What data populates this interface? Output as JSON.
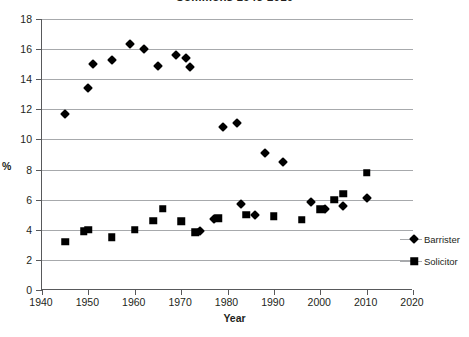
{
  "chart_data": {
    "type": "scatter",
    "title": "Commons 1945-2010",
    "xlabel": "Year",
    "ylabel": "%",
    "xlim": [
      1940,
      2020
    ],
    "ylim": [
      0,
      18
    ],
    "xticks": [
      1940,
      1950,
      1960,
      1970,
      1980,
      1990,
      2000,
      2010,
      2020
    ],
    "yticks": [
      0,
      2,
      4,
      6,
      8,
      10,
      12,
      14,
      16,
      18
    ],
    "grid": "horizontal",
    "legend_position": "right",
    "series": [
      {
        "name": "Barrister",
        "marker": "diamond",
        "color": "#000000",
        "points": [
          [
            1945,
            11.7
          ],
          [
            1950,
            13.4
          ],
          [
            1951,
            15.0
          ],
          [
            1955,
            15.3
          ],
          [
            1959,
            16.35
          ],
          [
            1962,
            16.0
          ],
          [
            1965,
            14.9
          ],
          [
            1969,
            15.6
          ],
          [
            1971,
            15.4
          ],
          [
            1972,
            14.8
          ],
          [
            1974,
            3.9
          ],
          [
            1977,
            4.7
          ],
          [
            1979,
            10.85
          ],
          [
            1982,
            11.1
          ],
          [
            1983,
            5.7
          ],
          [
            1986,
            5.0
          ],
          [
            1988,
            9.1
          ],
          [
            1992,
            8.5
          ],
          [
            1998,
            5.85
          ],
          [
            2001,
            5.4
          ],
          [
            2005,
            5.6
          ],
          [
            2010,
            6.1
          ]
        ]
      },
      {
        "name": "Solicitor",
        "marker": "square",
        "color": "#000000",
        "points": [
          [
            1945,
            3.2
          ],
          [
            1949,
            3.9
          ],
          [
            1950,
            4.0
          ],
          [
            1955,
            3.5
          ],
          [
            1960,
            4.0
          ],
          [
            1964,
            4.6
          ],
          [
            1966,
            5.4
          ],
          [
            1970,
            4.55
          ],
          [
            1973,
            3.85
          ],
          [
            1978,
            4.75
          ],
          [
            1984,
            5.0
          ],
          [
            1990,
            4.9
          ],
          [
            1996,
            4.65
          ],
          [
            2000,
            5.35
          ],
          [
            2003,
            6.0
          ],
          [
            2005,
            6.4
          ],
          [
            2010,
            7.8
          ]
        ]
      }
    ]
  }
}
